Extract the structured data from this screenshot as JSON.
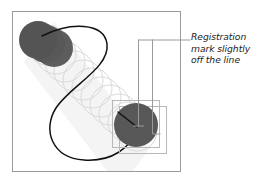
{
  "figure": {
    "annotation": {
      "lines": [
        "Registration",
        "mark slightly",
        "off the line"
      ],
      "full_text": "Registration mark slightly off the line"
    },
    "colors": {
      "background": "#ffffff",
      "frame_border": "#9a9a9a",
      "dark_circle": "#595959",
      "ghost_circle_stroke": "#d8d8d8",
      "band_fill": "#f2f2f2",
      "curve": "#111111",
      "leader_line": "#9a9a9a",
      "bounding_box": "#b5b5b5",
      "text": "#1a1a1a"
    },
    "frame": {
      "x": 12,
      "y": 11,
      "width": 169,
      "height": 161
    },
    "elements": {
      "dark_marks": [
        {
          "name": "top-left-mark-1",
          "cx": 38,
          "cy": 40,
          "r": 19
        },
        {
          "name": "top-left-mark-2",
          "cx": 46,
          "cy": 44,
          "r": 19
        },
        {
          "name": "top-left-mark-3",
          "cx": 54,
          "cy": 48,
          "r": 19
        },
        {
          "name": "bottom-right-mark",
          "cx": 136,
          "cy": 125,
          "r": 22
        }
      ],
      "ghost_trail_count": 11,
      "registration_boxes": [
        {
          "name": "inner-box",
          "x": 112,
          "y": 100,
          "width": 48,
          "height": 48
        },
        {
          "name": "outer-box",
          "x": 119,
          "y": 106,
          "width": 48,
          "height": 48
        }
      ],
      "leader": {
        "horizontal_y": 40,
        "horizontal_x1": 138,
        "horizontal_x2": 190,
        "vertical_left_x": 138,
        "vertical_left_bottom": 126,
        "vertical_right_x": 152,
        "vertical_right_bottom": 134,
        "jog_x2": 160
      }
    }
  }
}
